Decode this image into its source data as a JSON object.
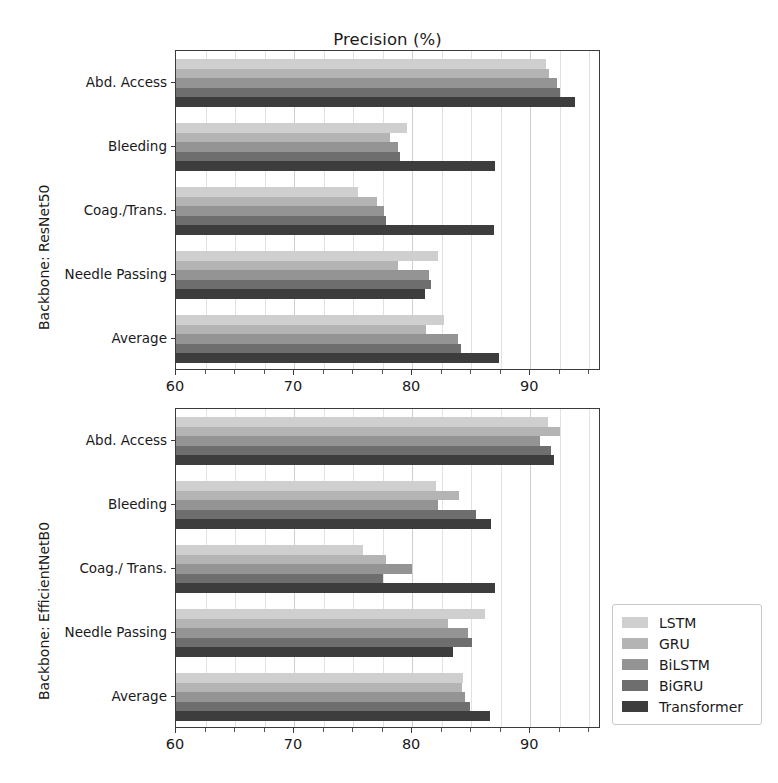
{
  "figure": {
    "title": "Precision (%)",
    "background": "#ffffff"
  },
  "legend": {
    "position": "right-bottom",
    "entries": [
      {
        "label": "LSTM",
        "color": "#cfcfcf"
      },
      {
        "label": "GRU",
        "color": "#b4b4b4"
      },
      {
        "label": "BiLSTM",
        "color": "#949494"
      },
      {
        "label": "BiGRU",
        "color": "#6e6e6e"
      },
      {
        "label": "Transformer",
        "color": "#3d3d3d"
      }
    ]
  },
  "axes": {
    "xlabel": "",
    "xticks": [
      60,
      70,
      80,
      90
    ],
    "xlim": [
      60,
      96
    ],
    "xminor_step": 2.5,
    "grid": true
  },
  "panels": [
    {
      "ylabel": "Backbone: ResNet50",
      "categories": [
        "Abd. Access",
        "Bleeding",
        "Coag./Trans.",
        "Needle Passing",
        "Average"
      ]
    },
    {
      "ylabel": "Backbone: EfficientNetB0",
      "categories": [
        "Abd. Access",
        "Bleeding",
        "Coag./ Trans.",
        "Needle Passing",
        "Average"
      ]
    }
  ],
  "chart_data": [
    {
      "type": "bar",
      "orientation": "horizontal",
      "title": "Precision (%)",
      "subtitle": "Backbone: ResNet50",
      "xlabel": "Precision (%)",
      "ylabel": "Backbone: ResNet50",
      "xlim": [
        60,
        96
      ],
      "xticks": [
        60,
        70,
        80,
        90
      ],
      "grid": true,
      "legend_position": "right",
      "categories": [
        "Abd. Access",
        "Bleeding",
        "Coag./Trans.",
        "Needle Passing",
        "Average"
      ],
      "series": [
        {
          "name": "LSTM",
          "color": "#cfcfcf",
          "values": [
            91.3,
            79.6,
            75.4,
            82.2,
            82.7
          ]
        },
        {
          "name": "GRU",
          "color": "#b4b4b4",
          "values": [
            91.6,
            78.1,
            77.0,
            78.8,
            81.2
          ]
        },
        {
          "name": "BiLSTM",
          "color": "#949494",
          "values": [
            92.3,
            78.8,
            77.6,
            81.4,
            83.9
          ]
        },
        {
          "name": "BiGRU",
          "color": "#6e6e6e",
          "values": [
            92.5,
            79.0,
            77.8,
            81.6,
            84.1
          ]
        },
        {
          "name": "Transformer",
          "color": "#3d3d3d",
          "values": [
            93.8,
            87.0,
            86.9,
            81.1,
            87.4
          ]
        }
      ]
    },
    {
      "type": "bar",
      "orientation": "horizontal",
      "title": "Precision (%)",
      "subtitle": "Backbone: EfficientNetB0",
      "xlabel": "Precision (%)",
      "ylabel": "Backbone: EfficientNetB0",
      "xlim": [
        60,
        96
      ],
      "xticks": [
        60,
        70,
        80,
        90
      ],
      "grid": true,
      "legend_position": "right",
      "categories": [
        "Abd. Access",
        "Bleeding",
        "Coag./ Trans.",
        "Needle Passing",
        "Average"
      ],
      "series": [
        {
          "name": "LSTM",
          "color": "#cfcfcf",
          "values": [
            91.5,
            82.0,
            75.8,
            86.2,
            84.3
          ]
        },
        {
          "name": "GRU",
          "color": "#b4b4b4",
          "values": [
            92.5,
            84.0,
            77.8,
            83.0,
            84.2
          ]
        },
        {
          "name": "BiLSTM",
          "color": "#949494",
          "values": [
            90.8,
            82.2,
            80.0,
            84.7,
            84.5
          ]
        },
        {
          "name": "BiGRU",
          "color": "#6e6e6e",
          "values": [
            91.8,
            85.4,
            77.5,
            85.1,
            84.9
          ]
        },
        {
          "name": "Transformer",
          "color": "#3d3d3d",
          "values": [
            92.0,
            86.7,
            87.0,
            83.5,
            86.6
          ]
        }
      ]
    }
  ]
}
